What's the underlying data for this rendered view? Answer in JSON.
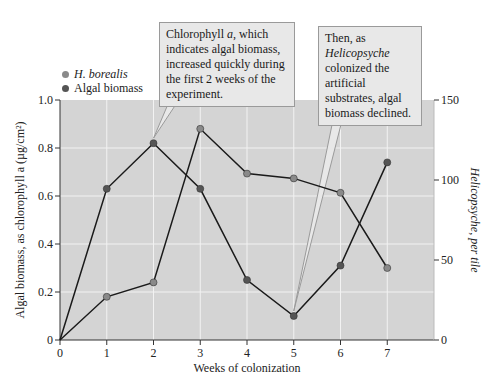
{
  "chart_data": {
    "type": "line",
    "title": "",
    "xlabel": "Weeks of colonization",
    "ylabel_left": "Algal biomass, as chlorophyll a (µg/cm²)",
    "ylabel_right": "Helicopsyche, per tile",
    "x": [
      0,
      1,
      2,
      3,
      4,
      5,
      6,
      7
    ],
    "x_ticks": [
      "0",
      "1",
      "2",
      "3",
      "4",
      "5",
      "6",
      "7"
    ],
    "xlim": [
      0,
      8
    ],
    "ylim_left": [
      0,
      1.0
    ],
    "ylim_right": [
      0,
      150
    ],
    "y_ticks_left": [
      "0",
      "0.2",
      "0.4",
      "0.6",
      "0.8",
      "1.0"
    ],
    "y_ticks_right": [
      "0",
      "50",
      "100",
      "150"
    ],
    "grid": true,
    "legend_position": "top-left",
    "series": [
      {
        "name": "H. borealis",
        "axis": "right",
        "color": "#8a8a8a",
        "values": [
          0,
          27,
          36,
          132,
          104,
          101,
          92,
          45
        ]
      },
      {
        "name": "Algal biomass",
        "axis": "left",
        "color": "#555555",
        "values": [
          0,
          0.63,
          0.82,
          0.63,
          0.25,
          0.1,
          0.31,
          0.74
        ]
      }
    ],
    "annotations": [
      {
        "id": "a1",
        "text_parts": [
          "Chlorophyll ",
          "a",
          ", which indicates algal biomass, increased quickly during the first 2 weeks of the experiment."
        ],
        "points_to": {
          "x": 2,
          "series": "Algal biomass"
        }
      },
      {
        "id": "a2",
        "text_parts": [
          "Then, as ",
          "Helicopsyche",
          " colonized the artificial substrates, algal biomass declined."
        ],
        "points_to": {
          "x": 5,
          "series": "Algal biomass"
        }
      }
    ]
  },
  "legend": {
    "items": [
      {
        "label": "H. borealis",
        "color": "#8a8a8a"
      },
      {
        "label": "Algal biomass",
        "color": "#555555"
      }
    ]
  },
  "colors": {
    "plot_bg": "#d4d4d4",
    "grid": "#f2f2f2",
    "line": "#1a1a1a",
    "callout_bg": "#e8e8e8"
  }
}
